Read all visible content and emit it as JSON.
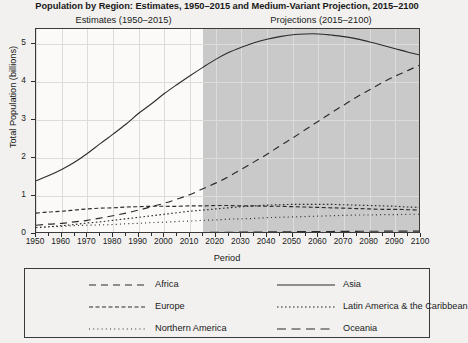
{
  "chart_data": {
    "type": "line",
    "title": "Population by Region: Estimates, 1950–2015 and Medium-Variant Projection, 2015–2100",
    "subtitle_left": "Estimates (1950–2015)",
    "subtitle_right": "Projections (2015–2100)",
    "xlabel": "Period",
    "ylabel": "Total Population (billions)",
    "xlim": [
      1950,
      2100
    ],
    "ylim": [
      0,
      5.4
    ],
    "yticks": [
      0,
      1,
      2,
      3,
      4,
      5
    ],
    "ytick_labels": [
      "0",
      "1",
      "2",
      "3",
      "4",
      "5"
    ],
    "xticks": [
      1950,
      1960,
      1970,
      1980,
      1990,
      2000,
      2010,
      2020,
      2030,
      2040,
      2050,
      2060,
      2070,
      2080,
      2090,
      2100
    ],
    "xtick_labels": [
      "1950",
      "1960",
      "1970",
      "1980",
      "1990",
      "2000",
      "2010",
      "2020",
      "2030",
      "2040",
      "2050",
      "2060",
      "2070",
      "2080",
      "2090",
      "2100"
    ],
    "grid": true,
    "legend_position": "below",
    "projection_split_year": 2015,
    "x": [
      1950,
      1955,
      1960,
      1965,
      1970,
      1975,
      1980,
      1985,
      1990,
      1995,
      2000,
      2005,
      2010,
      2015,
      2020,
      2025,
      2030,
      2035,
      2040,
      2045,
      2050,
      2055,
      2060,
      2065,
      2070,
      2075,
      2080,
      2085,
      2090,
      2095,
      2100
    ],
    "series": [
      {
        "name": "Africa",
        "style": "dashed",
        "values": [
          0.23,
          0.26,
          0.28,
          0.32,
          0.36,
          0.42,
          0.48,
          0.55,
          0.63,
          0.72,
          0.81,
          0.92,
          1.04,
          1.19,
          1.34,
          1.51,
          1.7,
          1.9,
          2.1,
          2.32,
          2.53,
          2.75,
          2.97,
          3.19,
          3.4,
          3.61,
          3.8,
          3.99,
          4.16,
          4.31,
          4.47
        ]
      },
      {
        "name": "Asia",
        "style": "solid",
        "values": [
          1.4,
          1.54,
          1.7,
          1.89,
          2.12,
          2.38,
          2.63,
          2.89,
          3.18,
          3.43,
          3.7,
          3.94,
          4.17,
          4.39,
          4.6,
          4.78,
          4.92,
          5.04,
          5.13,
          5.2,
          5.25,
          5.27,
          5.27,
          5.24,
          5.2,
          5.14,
          5.06,
          4.97,
          4.88,
          4.79,
          4.71
        ]
      },
      {
        "name": "Europe",
        "style": "dashdot",
        "values": [
          0.55,
          0.58,
          0.6,
          0.63,
          0.66,
          0.68,
          0.69,
          0.71,
          0.72,
          0.73,
          0.73,
          0.73,
          0.74,
          0.74,
          0.75,
          0.75,
          0.74,
          0.74,
          0.73,
          0.73,
          0.72,
          0.71,
          0.7,
          0.69,
          0.68,
          0.67,
          0.66,
          0.65,
          0.65,
          0.64,
          0.63
        ]
      },
      {
        "name": "Latin America & the Caribbean",
        "style": "dotted",
        "values": [
          0.17,
          0.19,
          0.22,
          0.25,
          0.29,
          0.32,
          0.36,
          0.4,
          0.44,
          0.48,
          0.52,
          0.56,
          0.6,
          0.63,
          0.66,
          0.69,
          0.72,
          0.74,
          0.76,
          0.77,
          0.78,
          0.78,
          0.78,
          0.78,
          0.77,
          0.76,
          0.75,
          0.74,
          0.73,
          0.71,
          0.7
        ]
      },
      {
        "name": "Northern America",
        "style": "finedot",
        "values": [
          0.17,
          0.19,
          0.2,
          0.22,
          0.23,
          0.24,
          0.25,
          0.27,
          0.28,
          0.3,
          0.31,
          0.33,
          0.34,
          0.36,
          0.37,
          0.39,
          0.4,
          0.41,
          0.43,
          0.44,
          0.45,
          0.46,
          0.47,
          0.48,
          0.49,
          0.5,
          0.5,
          0.51,
          0.51,
          0.52,
          0.52
        ]
      },
      {
        "name": "Oceania",
        "style": "longdash",
        "values": [
          0.013,
          0.014,
          0.016,
          0.018,
          0.02,
          0.021,
          0.023,
          0.025,
          0.027,
          0.029,
          0.031,
          0.033,
          0.037,
          0.04,
          0.043,
          0.046,
          0.049,
          0.052,
          0.055,
          0.058,
          0.06,
          0.063,
          0.065,
          0.067,
          0.069,
          0.071,
          0.072,
          0.074,
          0.075,
          0.076,
          0.077
        ]
      }
    ],
    "colors": {
      "line": "#2b2b2b",
      "plot_background": "#fbfaf9",
      "projection_band": "#c9c9c9",
      "page_background": "#f2f1ef",
      "grid": "#dedcd9"
    }
  },
  "legend": {
    "items": [
      {
        "label": "Africa",
        "style": "dashed"
      },
      {
        "label": "Asia",
        "style": "solid"
      },
      {
        "label": "Europe",
        "style": "dashdot"
      },
      {
        "label": "Latin America & the Caribbean",
        "style": "dotted"
      },
      {
        "label": "Northern America",
        "style": "finedot"
      },
      {
        "label": "Oceania",
        "style": "longdash"
      }
    ]
  }
}
